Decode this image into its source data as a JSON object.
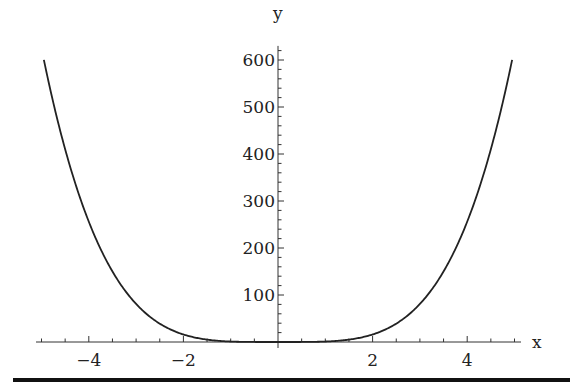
{
  "chart_data": {
    "type": "line",
    "title": "",
    "function": "y = x^4",
    "xlabel": "x",
    "ylabel": "y",
    "xlim": [
      -5.2,
      5.2
    ],
    "ylim": [
      0,
      625
    ],
    "x_ticks": [
      -4,
      -2,
      2,
      4
    ],
    "x_tick_labels": [
      "−4",
      "−2",
      "2",
      "4"
    ],
    "y_ticks": [
      100,
      200,
      300,
      400,
      500,
      600
    ],
    "y_tick_labels": [
      "100",
      "200",
      "300",
      "400",
      "500",
      "600"
    ],
    "x_minor_step": 0.5,
    "y_minor_step": 20,
    "grid": false,
    "legend": null,
    "series": [
      {
        "name": "x^4",
        "x": [
          -4.95,
          -4,
          -3,
          -2,
          -1,
          0,
          1,
          2,
          3,
          4,
          4.95
        ],
        "values": [
          600.4,
          256,
          81,
          16,
          1,
          0,
          1,
          16,
          81,
          256,
          600.4
        ],
        "color": "#222222"
      }
    ]
  },
  "colors": {
    "curve": "#222222",
    "axis": "#333333",
    "bottom_rule": "#111111"
  }
}
